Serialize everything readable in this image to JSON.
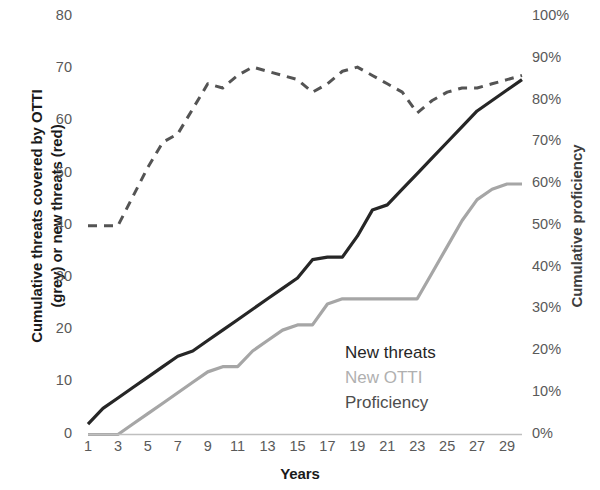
{
  "chart_data": {
    "type": "line",
    "title": "",
    "xlabel": "Years",
    "ylabel": "Cumulative threats covered by OTTI (grey) or new threats (red)",
    "ylabel_line1": "Cumulative threats covered by OTTI",
    "ylabel_line2": "(grey) or new threats (red)",
    "y2label": "Cumulative proficiency",
    "xlim": [
      1,
      30
    ],
    "ylim": [
      0,
      80
    ],
    "y2lim": [
      0,
      100
    ],
    "grid": false,
    "legend_position": "inside-lower-right",
    "x": [
      1,
      2,
      3,
      4,
      5,
      6,
      7,
      8,
      9,
      10,
      11,
      12,
      13,
      14,
      15,
      16,
      17,
      18,
      19,
      20,
      21,
      22,
      23,
      24,
      25,
      26,
      27,
      28,
      29,
      30
    ],
    "xticks": [
      1,
      3,
      5,
      7,
      9,
      11,
      13,
      15,
      17,
      19,
      21,
      23,
      25,
      27,
      29
    ],
    "xtick_labels": [
      "1",
      "3",
      "5",
      "7",
      "9",
      "11",
      "13",
      "15",
      "17",
      "19",
      "21",
      "23",
      "25",
      "27",
      "29"
    ],
    "yticks": [
      0,
      10,
      20,
      30,
      40,
      50,
      60,
      70,
      80
    ],
    "ytick_labels": [
      "0",
      "10",
      "20",
      "30",
      "40",
      "50",
      "60",
      "70",
      "80"
    ],
    "y2ticks": [
      0,
      10,
      20,
      30,
      40,
      50,
      60,
      70,
      80,
      90,
      100
    ],
    "y2tick_labels": [
      "0%",
      "10%",
      "20%",
      "30%",
      "40%",
      "50%",
      "60%",
      "70%",
      "80%",
      "90%",
      "100%"
    ],
    "series": [
      {
        "name": "New threats",
        "axis": "left",
        "color": "#262626",
        "style": "solid",
        "width": 3.2,
        "values": [
          2,
          5,
          7,
          9,
          11,
          13,
          15,
          16,
          18,
          20,
          22,
          24,
          26,
          28,
          30,
          33.5,
          34,
          34,
          38,
          43,
          44,
          47,
          50,
          53,
          56,
          59,
          62,
          64,
          66,
          68
        ]
      },
      {
        "name": "New OTTI",
        "axis": "left",
        "color": "#a6a6a6",
        "style": "solid",
        "width": 3.2,
        "values": [
          0,
          0,
          0,
          2,
          4,
          6,
          8,
          10,
          12,
          13,
          13,
          16,
          18,
          20,
          21,
          21,
          25,
          26,
          26,
          26,
          26,
          26,
          26,
          31,
          36,
          41,
          45,
          47,
          48,
          48
        ]
      },
      {
        "name": "Proficiency",
        "axis": "right",
        "color": "#545454",
        "style": "dashed",
        "width": 3,
        "values": [
          50,
          50,
          50,
          57,
          64,
          70,
          72,
          78,
          84,
          83,
          86,
          88,
          87,
          86,
          85,
          82,
          84,
          87,
          88,
          86,
          84,
          82,
          77,
          80,
          82,
          83,
          83,
          84,
          85,
          86
        ]
      }
    ],
    "legend": [
      {
        "label": "New threats",
        "color": "#262626"
      },
      {
        "label": "New OTTI",
        "color": "#b0b0b0"
      },
      {
        "label": "Proficiency",
        "color": "#4d4d4d"
      }
    ]
  }
}
